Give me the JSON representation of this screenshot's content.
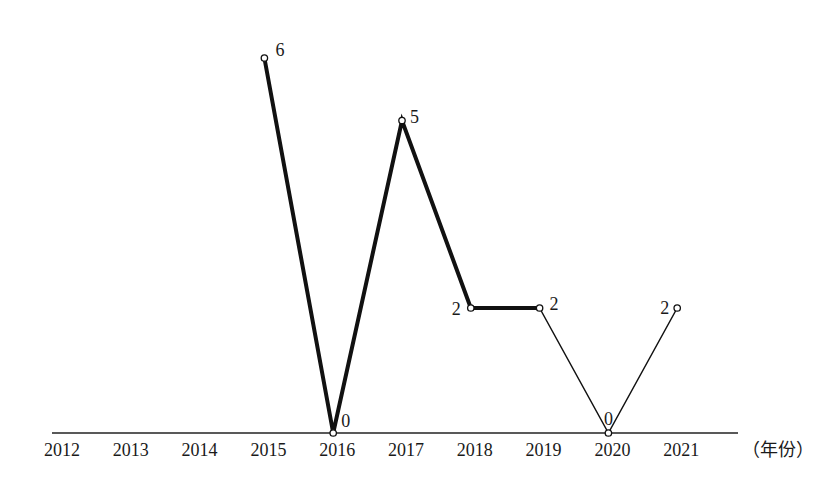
{
  "chart_data": {
    "type": "line",
    "title": "",
    "xlabel": "（年份）",
    "ylabel": "",
    "categories": [
      "2012",
      "2013",
      "2014",
      "2015",
      "2016",
      "2017",
      "2018",
      "2019",
      "2020",
      "2021"
    ],
    "series": [
      {
        "name": "solid-thick",
        "style": "thick",
        "x": [
          "2015",
          "2016",
          "2017",
          "2018",
          "2019"
        ],
        "values": [
          6,
          0,
          5,
          2,
          2
        ]
      },
      {
        "name": "solid-thin",
        "style": "thin",
        "x": [
          "2019",
          "2020",
          "2021"
        ],
        "values": [
          2,
          0,
          2
        ]
      }
    ],
    "points": [
      {
        "year": "2015",
        "value": 6
      },
      {
        "year": "2016",
        "value": 0
      },
      {
        "year": "2017",
        "value": 5
      },
      {
        "year": "2018",
        "value": 2
      },
      {
        "year": "2019",
        "value": 2
      },
      {
        "year": "2020",
        "value": 0
      },
      {
        "year": "2021",
        "value": 2
      }
    ],
    "ylim": [
      0,
      6
    ],
    "grid": false,
    "legend": "none"
  },
  "axis": {
    "unit_label": "（年份）"
  },
  "colors": {
    "line": "#111111",
    "background": "#ffffff"
  }
}
